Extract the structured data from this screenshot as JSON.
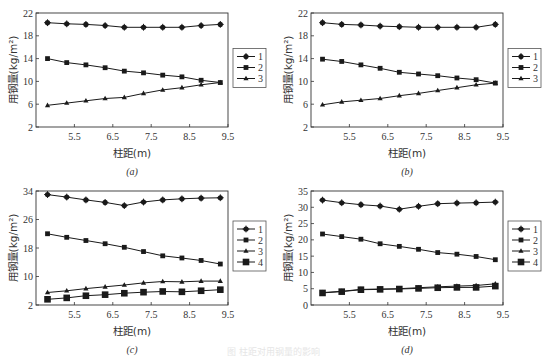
{
  "figure": {
    "caption": "图 柱距对用钢量的影响"
  },
  "chart_data": [
    {
      "type": "line",
      "panel_label": "(a)",
      "xlabel": "柱距(m)",
      "ylabel": "用钢量(kg/m²)",
      "xlim": [
        4.5,
        9.5
      ],
      "ylim": [
        2,
        22
      ],
      "xticks": [
        5.5,
        6.5,
        7.5,
        8.5,
        9.5
      ],
      "yticks": [
        2,
        6,
        10,
        14,
        18,
        22
      ],
      "x": [
        4.8,
        5.3,
        5.8,
        6.3,
        6.8,
        7.3,
        7.8,
        8.3,
        8.8,
        9.3
      ],
      "series": [
        {
          "name": "1",
          "marker": "star",
          "values": [
            20.3,
            20.1,
            20.0,
            19.8,
            19.5,
            19.5,
            19.5,
            19.5,
            19.8,
            20.0
          ]
        },
        {
          "name": "2",
          "marker": "square",
          "values": [
            14.0,
            13.3,
            12.9,
            12.4,
            11.8,
            11.5,
            11.1,
            10.8,
            10.2,
            9.8
          ]
        },
        {
          "name": "3",
          "marker": "triangle",
          "values": [
            5.8,
            6.2,
            6.6,
            7.0,
            7.2,
            7.9,
            8.5,
            8.9,
            9.4,
            9.8
          ]
        }
      ],
      "legend_position": "right"
    },
    {
      "type": "line",
      "panel_label": "(b)",
      "xlabel": "柱距(m)",
      "ylabel": "用钢量(kg/m²)",
      "xlim": [
        4.5,
        9.5
      ],
      "ylim": [
        2,
        22
      ],
      "xticks": [
        5.5,
        6.5,
        7.5,
        8.5,
        9.5
      ],
      "yticks": [
        2,
        6,
        10,
        14,
        18,
        22
      ],
      "x": [
        4.8,
        5.3,
        5.8,
        6.3,
        6.8,
        7.3,
        7.8,
        8.3,
        8.8,
        9.3
      ],
      "series": [
        {
          "name": "1",
          "marker": "star",
          "values": [
            20.3,
            20.0,
            19.9,
            19.7,
            19.6,
            19.5,
            19.5,
            19.5,
            19.5,
            20.0
          ]
        },
        {
          "name": "2",
          "marker": "square",
          "values": [
            13.9,
            13.5,
            12.9,
            12.3,
            11.6,
            11.3,
            11.0,
            10.6,
            10.3,
            9.7
          ]
        },
        {
          "name": "3",
          "marker": "triangle",
          "values": [
            5.9,
            6.4,
            6.7,
            7.0,
            7.5,
            7.9,
            8.4,
            8.9,
            9.4,
            9.7
          ]
        }
      ],
      "legend_position": "right"
    },
    {
      "type": "line",
      "panel_label": "(c)",
      "xlabel": "柱距(m)",
      "ylabel": "用钢量(kg/m²)",
      "xlim": [
        4.5,
        9.5
      ],
      "ylim": [
        2,
        34
      ],
      "xticks": [
        5.5,
        6.5,
        7.5,
        8.5,
        9.5
      ],
      "yticks": [
        2,
        10,
        18,
        26,
        34
      ],
      "x": [
        4.8,
        5.3,
        5.8,
        6.3,
        6.8,
        7.3,
        7.8,
        8.3,
        8.8,
        9.3
      ],
      "series": [
        {
          "name": "1",
          "marker": "star",
          "values": [
            33.0,
            32.3,
            31.5,
            30.8,
            29.9,
            30.9,
            31.5,
            31.8,
            32.0,
            32.1
          ]
        },
        {
          "name": "2",
          "marker": "square",
          "values": [
            22.0,
            21.0,
            20.1,
            19.2,
            18.2,
            17.0,
            15.8,
            15.2,
            14.5,
            13.5
          ]
        },
        {
          "name": "3",
          "marker": "triangle",
          "values": [
            5.5,
            6.0,
            6.6,
            7.1,
            7.6,
            8.2,
            8.6,
            8.5,
            8.7,
            8.7
          ]
        },
        {
          "name": "4",
          "marker": "big-square",
          "values": [
            3.6,
            4.0,
            4.6,
            4.9,
            5.3,
            5.6,
            5.8,
            5.7,
            6.0,
            6.3
          ]
        }
      ],
      "legend_position": "right"
    },
    {
      "type": "line",
      "panel_label": "(d)",
      "xlabel": "柱距(m)",
      "ylabel": "用钢量(kg/m²)",
      "xlim": [
        4.5,
        9.5
      ],
      "ylim": [
        0,
        35
      ],
      "xticks": [
        5.5,
        6.5,
        7.5,
        8.5,
        9.5
      ],
      "yticks": [
        0,
        5,
        10,
        15,
        20,
        25,
        30,
        35
      ],
      "x": [
        4.8,
        5.3,
        5.8,
        6.3,
        6.8,
        7.3,
        7.8,
        8.3,
        8.8,
        9.3
      ],
      "series": [
        {
          "name": "1",
          "marker": "star",
          "values": [
            32.2,
            31.4,
            30.8,
            30.4,
            29.4,
            30.3,
            31.1,
            31.3,
            31.4,
            31.6
          ]
        },
        {
          "name": "2",
          "marker": "square",
          "values": [
            21.8,
            21.0,
            20.2,
            18.8,
            18.0,
            17.1,
            16.1,
            15.6,
            14.9,
            13.9
          ]
        },
        {
          "name": "3",
          "marker": "triangle",
          "values": [
            3.8,
            4.2,
            4.8,
            4.9,
            5.0,
            5.3,
            5.6,
            5.8,
            6.0,
            6.5
          ]
        },
        {
          "name": "4",
          "marker": "big-square",
          "values": [
            3.7,
            4.1,
            4.7,
            4.8,
            4.9,
            5.1,
            5.3,
            5.4,
            5.4,
            5.8
          ]
        }
      ],
      "legend_position": "right"
    }
  ]
}
